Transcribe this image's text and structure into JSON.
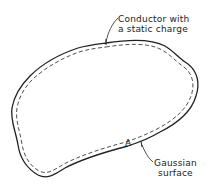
{
  "figure": {
    "labels": {
      "conductor_line1": "Conductor with",
      "conductor_line2": "a static charge",
      "point": "A",
      "gaussian_line1": "Gaussian",
      "gaussian_line2": "surface"
    },
    "colors": {
      "stroke": "#222222",
      "background": "#ffffff"
    }
  }
}
